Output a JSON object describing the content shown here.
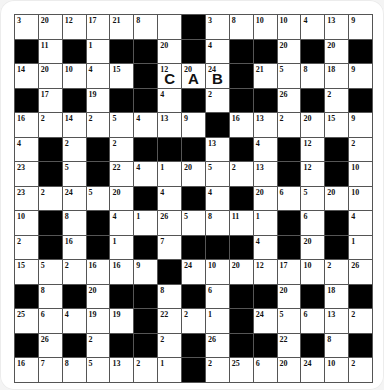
{
  "puzzle": {
    "type": "codeword",
    "rows": 15,
    "cols": 15,
    "black_marker": "#",
    "colors": {
      "block": "#000000",
      "cell": "#ffffff",
      "gridline": "#555555"
    },
    "grid": [
      [
        "3",
        "20",
        "12",
        "17",
        "21",
        "8",
        "",
        "#",
        "3",
        "8",
        "10",
        "10",
        "4",
        "13",
        "9"
      ],
      [
        "#",
        "11",
        "#",
        "1",
        "#",
        "#",
        "20",
        "#",
        "4",
        "#",
        "#",
        "20",
        "#",
        "20",
        "#"
      ],
      [
        "14",
        "20",
        "10",
        "4",
        "15",
        "#",
        "12",
        "20",
        "24",
        "#",
        "21",
        "5",
        "8",
        "18",
        "9"
      ],
      [
        "#",
        "17",
        "#",
        "19",
        "#",
        "#",
        "4",
        "#",
        "2",
        "#",
        "#",
        "26",
        "#",
        "2",
        "#"
      ],
      [
        "16",
        "2",
        "14",
        "2",
        "5",
        "4",
        "13",
        "9",
        "#",
        "16",
        "13",
        "2",
        "20",
        "15",
        "9"
      ],
      [
        "4",
        "#",
        "2",
        "#",
        "2",
        "#",
        "#",
        "#",
        "13",
        "#",
        "4",
        "#",
        "12",
        "#",
        "2"
      ],
      [
        "23",
        "#",
        "5",
        "#",
        "22",
        "4",
        "1",
        "20",
        "5",
        "2",
        "13",
        "#",
        "12",
        "#",
        "10"
      ],
      [
        "23",
        "2",
        "24",
        "5",
        "20",
        "#",
        "4",
        "#",
        "4",
        "#",
        "20",
        "6",
        "5",
        "20",
        "10"
      ],
      [
        "10",
        "#",
        "8",
        "#",
        "4",
        "1",
        "26",
        "5",
        "8",
        "11",
        "1",
        "#",
        "6",
        "#",
        "4"
      ],
      [
        "2",
        "#",
        "16",
        "#",
        "1",
        "#",
        "7",
        "#",
        "#",
        "#",
        "4",
        "#",
        "20",
        "#",
        "1"
      ],
      [
        "15",
        "5",
        "2",
        "16",
        "16",
        "9",
        "#",
        "24",
        "10",
        "20",
        "12",
        "17",
        "10",
        "2",
        "26"
      ],
      [
        "#",
        "8",
        "#",
        "20",
        "#",
        "#",
        "8",
        "#",
        "6",
        "#",
        "#",
        "20",
        "#",
        "18",
        "#"
      ],
      [
        "25",
        "6",
        "4",
        "19",
        "19",
        "#",
        "22",
        "2",
        "1",
        "#",
        "24",
        "5",
        "6",
        "13",
        "2"
      ],
      [
        "#",
        "26",
        "#",
        "2",
        "#",
        "#",
        "2",
        "#",
        "26",
        "#",
        "#",
        "22",
        "#",
        "8",
        "#"
      ],
      [
        "16",
        "7",
        "8",
        "5",
        "13",
        "2",
        "1",
        "#",
        "2",
        "25",
        "6",
        "20",
        "24",
        "10",
        "2"
      ]
    ],
    "given_letters": [
      {
        "row": 2,
        "col": 6,
        "number": "12",
        "letter": "C"
      },
      {
        "row": 2,
        "col": 7,
        "number": "20",
        "letter": "A"
      },
      {
        "row": 2,
        "col": 8,
        "number": "24",
        "letter": "B"
      }
    ]
  }
}
